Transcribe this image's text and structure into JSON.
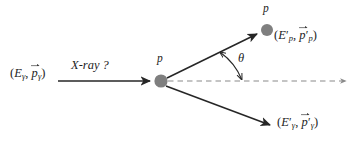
{
  "figure": {
    "kind": "compton-scattering-feynman-style-kinematics-diagram",
    "background_color": "#ffffff",
    "line_color": "#262626",
    "dashed_line_color": "#8a8a8a",
    "particle_fill_color": "#7f7f7f",
    "text_color": "#1d1d1d"
  },
  "labels": {
    "incoming_photon": {
      "open_paren": "(",
      "energy_symbol": "E",
      "energy_sub": "γ",
      "comma": ", ",
      "momentum_symbol": "p",
      "momentum_sub": "γ",
      "close_paren": ")",
      "plain_text": "(Eγ, p⃗γ)"
    },
    "xray_question": "X-ray ?",
    "vertex_particle": "p",
    "scattered_particle": "p",
    "scattered_proton": {
      "open_paren": "(",
      "energy_symbol": "E",
      "energy_prime": "′",
      "energy_sub": "p",
      "comma": ", ",
      "momentum_symbol": "p",
      "momentum_prime": "′",
      "momentum_sub": "p",
      "close_paren": ")",
      "plain_text": "(E′p, p⃗′p)"
    },
    "scattered_photon": {
      "open_paren": "(",
      "energy_symbol": "E",
      "energy_prime": "′",
      "energy_sub": "γ",
      "comma": ", ",
      "momentum_symbol": "p",
      "momentum_prime": "′",
      "momentum_sub": "γ",
      "close_paren": ")",
      "plain_text": "(E′γ, p⃗′γ)"
    },
    "scattering_angle": "θ"
  },
  "geometry": {
    "vertex": {
      "x": 161,
      "y": 81,
      "radius": 6.5
    },
    "scattered_proton_dot": {
      "x": 267,
      "y": 30,
      "radius": 6.0
    },
    "incoming_arrow": {
      "x1": 58,
      "y1": 81,
      "x2": 152,
      "y2": 81
    },
    "proton_arrow": {
      "x1": 166,
      "y1": 78,
      "x2": 259,
      "y2": 33
    },
    "photon_arrow": {
      "x1": 165,
      "y1": 86,
      "x2": 272,
      "y2": 126
    },
    "axis_dashed": {
      "x1": 168,
      "y1": 81,
      "x2": 348,
      "y2": 81
    },
    "angle_arc": {
      "cx": 161,
      "cy": 81,
      "radius": 66,
      "start_deg": 0,
      "end_deg": 26
    }
  }
}
